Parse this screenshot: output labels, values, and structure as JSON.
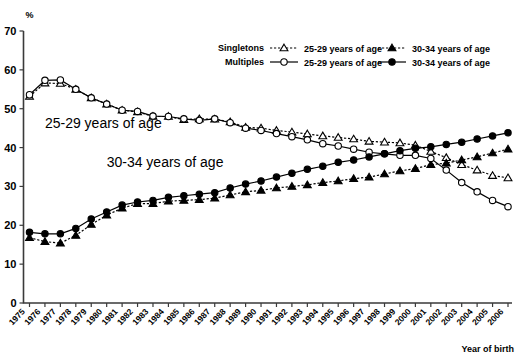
{
  "chart_data": {
    "type": "line",
    "title": "",
    "xlabel": "Year of birth",
    "ylabel": "%",
    "ylim": [
      0,
      70
    ],
    "yticks": [
      0,
      10,
      20,
      30,
      40,
      50,
      60,
      70
    ],
    "grid": false,
    "legend_position": "top-right",
    "categories": [
      "1975",
      "1976",
      "1977",
      "1978",
      "1979",
      "1980",
      "1981",
      "1982",
      "1983",
      "1984",
      "1985",
      "1986",
      "1987",
      "1988",
      "1989",
      "1990",
      "1991",
      "1992",
      "1993",
      "1994",
      "1995",
      "1996",
      "1997",
      "1998",
      "1999",
      "2000",
      "2001",
      "2002",
      "2003",
      "2004",
      "2005",
      "2006"
    ],
    "series": [
      {
        "name": "Singletons 25-29 years of age",
        "group": "Singletons",
        "age": "25-29 years of age",
        "marker": "open-triangle",
        "line": "dotted",
        "values": [
          53.2,
          56.6,
          56.5,
          55.0,
          52.8,
          51.2,
          49.6,
          49.2,
          48.0,
          48.0,
          47.2,
          47.4,
          47.3,
          46.6,
          45.2,
          45.0,
          44.4,
          44.0,
          43.5,
          43.0,
          42.6,
          42.2,
          41.6,
          41.4,
          41.2,
          40.6,
          39.0,
          37.4,
          35.6,
          34.2,
          32.8,
          32.2
        ]
      },
      {
        "name": "Multiples 25-29 years of age",
        "group": "Multiples",
        "age": "25-29 years of age",
        "marker": "open-circle",
        "line": "solid",
        "values": [
          53.6,
          57.3,
          57.4,
          55.0,
          52.8,
          51.2,
          49.6,
          49.3,
          48.1,
          48.0,
          47.4,
          47.0,
          47.4,
          46.4,
          45.0,
          44.4,
          43.6,
          42.8,
          42.0,
          41.0,
          40.4,
          39.6,
          38.8,
          38.4,
          38.0,
          38.0,
          37.2,
          34.2,
          31.0,
          28.6,
          26.4,
          24.8
        ]
      },
      {
        "name": "Singletons 30-34 years of age",
        "group": "Singletons",
        "age": "30-34 years of age",
        "marker": "filled-triangle",
        "line": "dotted",
        "values": [
          16.8,
          15.8,
          15.4,
          17.4,
          20.2,
          22.6,
          24.4,
          25.6,
          25.6,
          26.2,
          26.4,
          26.6,
          27.0,
          27.8,
          28.6,
          29.0,
          29.6,
          30.0,
          30.4,
          31.0,
          31.4,
          32.0,
          32.4,
          33.2,
          34.0,
          34.6,
          35.6,
          36.0,
          36.8,
          37.6,
          38.6,
          39.6
        ]
      },
      {
        "name": "Multiples 30-34 years of age",
        "group": "Multiples",
        "age": "30-34 years of age",
        "marker": "filled-circle",
        "line": "solid",
        "values": [
          18.2,
          17.8,
          17.8,
          19.2,
          21.6,
          23.4,
          25.2,
          26.0,
          26.4,
          27.2,
          27.6,
          28.0,
          28.4,
          29.6,
          30.6,
          31.4,
          32.4,
          33.4,
          34.4,
          35.2,
          36.2,
          36.8,
          37.6,
          38.4,
          39.2,
          39.8,
          40.2,
          40.8,
          41.4,
          42.2,
          43.0,
          43.8
        ]
      }
    ],
    "annotations": [
      {
        "text": "25-29   years of age",
        "x": "1976",
        "y": 45
      },
      {
        "text": "30-34   years of age",
        "x": "1980",
        "y": 35
      }
    ]
  },
  "legend": {
    "rows": [
      {
        "head": "Singletons",
        "items": [
          {
            "marker": "open-triangle",
            "line": "dotted",
            "label": "25-29 years of age"
          },
          {
            "marker": "filled-triangle",
            "line": "dotted",
            "label": "30-34 years of age"
          }
        ]
      },
      {
        "head": "Multiples",
        "items": [
          {
            "marker": "open-circle",
            "line": "solid",
            "label": "25-29 years of age"
          },
          {
            "marker": "filled-circle",
            "line": "solid",
            "label": "30-34 years of age"
          }
        ]
      }
    ]
  },
  "colors": {
    "ink": "#000000",
    "axis": "#3a3a3a",
    "background": "#ffffff"
  }
}
